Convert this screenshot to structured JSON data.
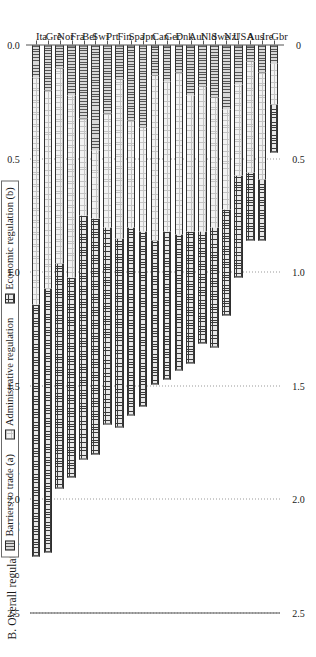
{
  "chart_data": {
    "type": "bar",
    "subtype": "stacked-horizontal",
    "title": "B. Overall regulatory approaches by area, 1998 (2)",
    "xlabel": "",
    "ylabel": "",
    "xlim": [
      0,
      2.5
    ],
    "ticks": [
      "0",
      "0.5",
      "1.0",
      "1.5",
      "2.0",
      "2.5"
    ],
    "tick_values": [
      0,
      0.5,
      1.0,
      1.5,
      2.0,
      2.5
    ],
    "grid": true,
    "legend_position": "top",
    "categories": [
      "Ita",
      "Gre",
      "Nor",
      "Fra",
      "Bel",
      "Swi",
      "Prt",
      "Fin",
      "Spa",
      "Jpn",
      "Can",
      "Ger",
      "Dnk",
      "Aut",
      "Nld",
      "Swe",
      "Nzl",
      "USA",
      "Aus",
      "Ire",
      "Gbr"
    ],
    "series": [
      {
        "name": "Barriers to trade (a)",
        "pattern": "vertical-lines",
        "values": [
          0.14,
          0.2,
          0.1,
          0.22,
          0.32,
          0.46,
          0.3,
          0.15,
          0.33,
          0.36,
          0.13,
          0.16,
          0.12,
          0.22,
          0.18,
          0.23,
          0.28,
          0.17,
          0.07,
          0.12,
          0.08
        ]
      },
      {
        "name": "Administrative regulation",
        "pattern": "fine-dots",
        "values": [
          1.0,
          0.87,
          0.86,
          0.8,
          0.43,
          0.3,
          0.5,
          0.7,
          0.47,
          0.46,
          0.73,
          0.66,
          0.71,
          0.6,
          0.64,
          0.57,
          0.44,
          0.4,
          0.49,
          0.47,
          0.18
        ]
      },
      {
        "name": "Economic regulation (b)",
        "pattern": "grid-hatch",
        "values": [
          1.11,
          1.16,
          0.99,
          0.88,
          1.07,
          1.04,
          0.87,
          0.83,
          0.83,
          0.77,
          0.63,
          0.65,
          0.6,
          0.58,
          0.49,
          0.53,
          0.47,
          0.45,
          0.3,
          0.27,
          0.21
        ]
      }
    ],
    "totals": [
      2.25,
      2.23,
      1.95,
      1.9,
      1.82,
      1.8,
      1.67,
      1.68,
      1.63,
      1.59,
      1.49,
      1.47,
      1.43,
      1.4,
      1.31,
      1.33,
      1.19,
      1.02,
      0.86,
      0.86,
      0.47
    ]
  }
}
